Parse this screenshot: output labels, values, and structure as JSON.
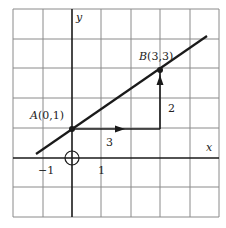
{
  "diagram": {
    "axes": {
      "x_label": "x",
      "y_label": "y"
    },
    "ticks": {
      "neg_one": "−1",
      "one": "1"
    },
    "points": {
      "A": {
        "name": "A",
        "coords": "(0,1)"
      },
      "B": {
        "name": "B",
        "coords": "(3,3)"
      }
    },
    "run_label": "3",
    "rise_label": "2",
    "grid": {
      "x_range": [
        -2,
        5
      ],
      "y_range": [
        -2,
        5
      ],
      "cell_px": 29.5
    },
    "colors": {
      "line": "#1a1a1a",
      "grid": "#8a8a8a",
      "background": "#ffffff"
    }
  }
}
